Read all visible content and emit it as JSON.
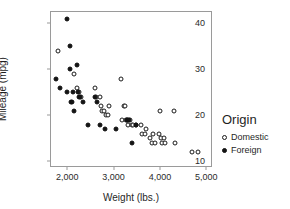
{
  "chart_data": {
    "type": "scatter",
    "title": "",
    "xlabel": "Weight (lbs.)",
    "ylabel": "Mileage (mpg)",
    "xlim": [
      1650,
      5100
    ],
    "ylim": [
      9,
      42.5
    ],
    "xticks": [
      2000,
      3000,
      4000,
      5000
    ],
    "xtick_labels": [
      "2,000",
      "3,000",
      "4,000",
      "5,000"
    ],
    "yticks": [
      10,
      20,
      30,
      40
    ],
    "ytick_labels": [
      "10",
      "20",
      "30",
      "40"
    ],
    "grid": false,
    "legend": {
      "title": "Origin",
      "position": "right",
      "entries": [
        {
          "label": "Domestic",
          "marker": "open-circle",
          "color": "#ffffff",
          "edge": "#1a1a1a"
        },
        {
          "label": "Foreign",
          "marker": "filled-circle",
          "color": "#141414",
          "edge": "#111111"
        }
      ]
    },
    "series": [
      {
        "name": "Domestic",
        "marker": "open-circle",
        "points": [
          [
            1800,
            34
          ],
          [
            2150,
            29
          ],
          [
            2200,
            26
          ],
          [
            2250,
            25
          ],
          [
            2300,
            24
          ],
          [
            2600,
            26
          ],
          [
            2620,
            24
          ],
          [
            2700,
            24
          ],
          [
            2720,
            22
          ],
          [
            2760,
            21
          ],
          [
            2800,
            21
          ],
          [
            2830,
            20
          ],
          [
            2880,
            20
          ],
          [
            2900,
            22
          ],
          [
            3150,
            28
          ],
          [
            3180,
            19
          ],
          [
            3220,
            22
          ],
          [
            3250,
            22
          ],
          [
            3260,
            19
          ],
          [
            3280,
            19
          ],
          [
            3300,
            18
          ],
          [
            3350,
            19
          ],
          [
            3400,
            18
          ],
          [
            3420,
            18
          ],
          [
            3480,
            18
          ],
          [
            3600,
            18
          ],
          [
            3620,
            16
          ],
          [
            3680,
            16
          ],
          [
            3700,
            17
          ],
          [
            3780,
            15
          ],
          [
            3820,
            14
          ],
          [
            3850,
            16
          ],
          [
            3900,
            14
          ],
          [
            3980,
            16
          ],
          [
            4000,
            21
          ],
          [
            4020,
            15
          ],
          [
            4050,
            14
          ],
          [
            4080,
            15
          ],
          [
            4100,
            14
          ],
          [
            4300,
            21
          ],
          [
            4330,
            14
          ],
          [
            4700,
            12
          ],
          [
            4820,
            12
          ]
        ]
      },
      {
        "name": "Foreign",
        "marker": "filled-circle",
        "points": [
          [
            1760,
            28
          ],
          [
            1850,
            26
          ],
          [
            2000,
            41
          ],
          [
            2000,
            25
          ],
          [
            2050,
            35
          ],
          [
            2060,
            30
          ],
          [
            2080,
            23
          ],
          [
            2100,
            23
          ],
          [
            2120,
            25
          ],
          [
            2150,
            21
          ],
          [
            2200,
            31
          ],
          [
            2230,
            25
          ],
          [
            2250,
            24
          ],
          [
            2280,
            24
          ],
          [
            2350,
            23
          ],
          [
            2450,
            18
          ],
          [
            2600,
            24
          ],
          [
            2650,
            23
          ],
          [
            2700,
            18
          ],
          [
            2820,
            17
          ],
          [
            3050,
            17
          ],
          [
            3280,
            19
          ],
          [
            3300,
            19
          ],
          [
            3340,
            19
          ],
          [
            3400,
            14
          ],
          [
            3480,
            18
          ]
        ]
      }
    ]
  }
}
